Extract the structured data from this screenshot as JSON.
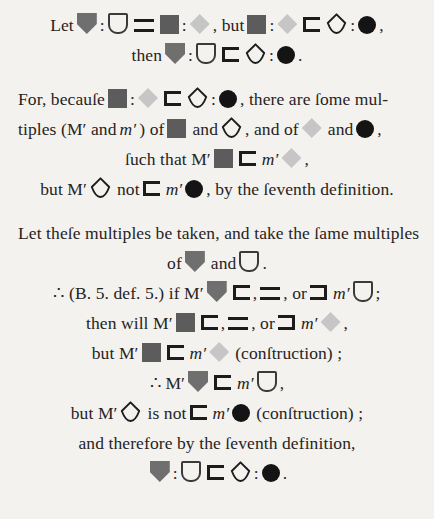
{
  "document": {
    "type": "euclid-proof-page",
    "edition": "Byrne symbolic Euclid (grayscale)",
    "background_color": "#f4f2ee",
    "text_color": "#26241f"
  },
  "symbols": {
    "shield_filled": {
      "name": "shield-filled-grey",
      "color": "#6f6f6f"
    },
    "shield_outline": {
      "name": "shield-outline",
      "color": "#3a3a3a"
    },
    "square_filled": {
      "name": "square-filled-dark-grey",
      "color": "#5c5c5c"
    },
    "diamond_filled": {
      "name": "diamond-filled-light-grey",
      "color": "#c6c6c6"
    },
    "diamond_outline": {
      "name": "diamond-outline",
      "color": "#1c1c1c"
    },
    "circle_filled": {
      "name": "circle-filled-black",
      "color": "#141414"
    },
    "less_than": {
      "name": "less-than-bracket",
      "color": "#1c1c1c"
    },
    "greater_than": {
      "name": "greater-than-bracket",
      "color": "#1c1c1c"
    },
    "equals": {
      "name": "equals-sign",
      "color": "#1c1c1c"
    }
  },
  "blocks": [
    {
      "id": "block-1",
      "lines": [
        {
          "id": "line-1",
          "align": "center",
          "parts": [
            {
              "t": "text",
              "v": "Let"
            },
            {
              "t": "sym",
              "v": "shield_filled"
            },
            {
              "t": "text",
              "v": ":"
            },
            {
              "t": "sym",
              "v": "shield_outline"
            },
            {
              "t": "sym",
              "v": "equals"
            },
            {
              "t": "sym",
              "v": "square_filled"
            },
            {
              "t": "text",
              "v": ":"
            },
            {
              "t": "sym",
              "v": "diamond_filled"
            },
            {
              "t": "text",
              "v": ", but"
            },
            {
              "t": "sym",
              "v": "square_filled"
            },
            {
              "t": "text",
              "v": ":"
            },
            {
              "t": "sym",
              "v": "diamond_filled"
            },
            {
              "t": "sym",
              "v": "less_than"
            },
            {
              "t": "sym",
              "v": "diamond_outline"
            },
            {
              "t": "text",
              "v": ":"
            },
            {
              "t": "sym",
              "v": "circle_filled"
            },
            {
              "t": "text",
              "v": ","
            }
          ]
        },
        {
          "id": "line-2",
          "align": "center",
          "parts": [
            {
              "t": "text",
              "v": "then"
            },
            {
              "t": "sym",
              "v": "shield_filled"
            },
            {
              "t": "text",
              "v": ":"
            },
            {
              "t": "sym",
              "v": "shield_outline"
            },
            {
              "t": "sym",
              "v": "less_than"
            },
            {
              "t": "sym",
              "v": "diamond_outline"
            },
            {
              "t": "text",
              "v": ":"
            },
            {
              "t": "sym",
              "v": "circle_filled"
            },
            {
              "t": "text",
              "v": "."
            }
          ]
        }
      ]
    },
    {
      "id": "block-2",
      "lines": [
        {
          "id": "line-3",
          "align": "left",
          "parts": [
            {
              "t": "text",
              "v": "For, becauſe"
            },
            {
              "t": "sym",
              "v": "square_filled"
            },
            {
              "t": "text",
              "v": ":"
            },
            {
              "t": "sym",
              "v": "diamond_filled"
            },
            {
              "t": "sym",
              "v": "less_than"
            },
            {
              "t": "sym",
              "v": "diamond_outline"
            },
            {
              "t": "text",
              "v": ":"
            },
            {
              "t": "sym",
              "v": "circle_filled"
            },
            {
              "t": "text",
              "v": ", there are ſome mul-"
            }
          ]
        },
        {
          "id": "line-4",
          "align": "left",
          "parts": [
            {
              "t": "text",
              "v": "tiples (M′ and"
            },
            {
              "t": "ital",
              "v": "m′"
            },
            {
              "t": "text",
              "v": ") of"
            },
            {
              "t": "sym",
              "v": "square_filled"
            },
            {
              "t": "text",
              "v": "and"
            },
            {
              "t": "sym",
              "v": "diamond_outline"
            },
            {
              "t": "text",
              "v": ", and of"
            },
            {
              "t": "sym",
              "v": "diamond_filled"
            },
            {
              "t": "text",
              "v": "and"
            },
            {
              "t": "sym",
              "v": "circle_filled"
            },
            {
              "t": "text",
              "v": ","
            }
          ]
        },
        {
          "id": "line-5",
          "align": "center",
          "parts": [
            {
              "t": "text",
              "v": "ſuch that M′"
            },
            {
              "t": "sym",
              "v": "square_filled"
            },
            {
              "t": "sym",
              "v": "less_than"
            },
            {
              "t": "ital",
              "v": "m′"
            },
            {
              "t": "sym",
              "v": "diamond_filled"
            },
            {
              "t": "text",
              "v": ","
            }
          ]
        },
        {
          "id": "line-6",
          "align": "center",
          "parts": [
            {
              "t": "text",
              "v": "but M′"
            },
            {
              "t": "sym",
              "v": "diamond_outline"
            },
            {
              "t": "text",
              "v": "not"
            },
            {
              "t": "sym",
              "v": "less_than"
            },
            {
              "t": "ital",
              "v": "m′"
            },
            {
              "t": "sym",
              "v": "circle_filled"
            },
            {
              "t": "text",
              "v": ", by the ſeventh definition."
            }
          ]
        }
      ]
    },
    {
      "id": "block-3",
      "lines": [
        {
          "id": "line-7",
          "align": "left",
          "parts": [
            {
              "t": "text",
              "v": "Let theſe multiples be taken, and take the ſame multiples"
            }
          ]
        },
        {
          "id": "line-8",
          "align": "center",
          "parts": [
            {
              "t": "text",
              "v": "of"
            },
            {
              "t": "sym",
              "v": "shield_filled"
            },
            {
              "t": "text",
              "v": "and"
            },
            {
              "t": "sym",
              "v": "shield_outline"
            },
            {
              "t": "text",
              "v": "."
            }
          ]
        },
        {
          "id": "line-9",
          "align": "center",
          "parts": [
            {
              "t": "text",
              "v": "∴ (B. 5. def. 5.) if M′"
            },
            {
              "t": "sym",
              "v": "shield_filled"
            },
            {
              "t": "sym",
              "v": "less_than"
            },
            {
              "t": "text",
              "v": ","
            },
            {
              "t": "sym",
              "v": "equals"
            },
            {
              "t": "text",
              "v": ", or"
            },
            {
              "t": "sym",
              "v": "greater_than"
            },
            {
              "t": "ital",
              "v": "m′"
            },
            {
              "t": "sym",
              "v": "shield_outline"
            },
            {
              "t": "text",
              "v": ";"
            }
          ]
        },
        {
          "id": "line-10",
          "align": "center",
          "parts": [
            {
              "t": "text",
              "v": "then will M′"
            },
            {
              "t": "sym",
              "v": "square_filled"
            },
            {
              "t": "sym",
              "v": "less_than"
            },
            {
              "t": "text",
              "v": ","
            },
            {
              "t": "sym",
              "v": "equals"
            },
            {
              "t": "text",
              "v": ", or"
            },
            {
              "t": "sym",
              "v": "greater_than"
            },
            {
              "t": "ital",
              "v": "m′"
            },
            {
              "t": "sym",
              "v": "diamond_filled"
            },
            {
              "t": "text",
              "v": ","
            }
          ]
        },
        {
          "id": "line-11",
          "align": "center",
          "parts": [
            {
              "t": "text",
              "v": "but M′"
            },
            {
              "t": "sym",
              "v": "square_filled"
            },
            {
              "t": "sym",
              "v": "less_than"
            },
            {
              "t": "ital",
              "v": "m′"
            },
            {
              "t": "sym",
              "v": "diamond_filled"
            },
            {
              "t": "text",
              "v": "(conſtruction) ;"
            }
          ]
        },
        {
          "id": "line-12",
          "align": "center",
          "parts": [
            {
              "t": "text",
              "v": "∴ M′"
            },
            {
              "t": "sym",
              "v": "shield_filled"
            },
            {
              "t": "sym",
              "v": "less_than"
            },
            {
              "t": "ital",
              "v": "m′"
            },
            {
              "t": "sym",
              "v": "shield_outline"
            },
            {
              "t": "text",
              "v": ","
            }
          ]
        },
        {
          "id": "line-13",
          "align": "center",
          "parts": [
            {
              "t": "text",
              "v": "but M′"
            },
            {
              "t": "sym",
              "v": "diamond_outline"
            },
            {
              "t": "text",
              "v": "is not"
            },
            {
              "t": "sym",
              "v": "less_than"
            },
            {
              "t": "ital",
              "v": "m′"
            },
            {
              "t": "sym",
              "v": "circle_filled"
            },
            {
              "t": "text",
              "v": "(conſtruction) ;"
            }
          ]
        },
        {
          "id": "line-14",
          "align": "center",
          "parts": [
            {
              "t": "text",
              "v": "and therefore by the ſeventh definition,"
            }
          ]
        },
        {
          "id": "line-15",
          "align": "center",
          "parts": [
            {
              "t": "sym",
              "v": "shield_filled"
            },
            {
              "t": "text",
              "v": ":"
            },
            {
              "t": "sym",
              "v": "shield_outline"
            },
            {
              "t": "sym",
              "v": "less_than"
            },
            {
              "t": "sym",
              "v": "diamond_outline"
            },
            {
              "t": "text",
              "v": ":"
            },
            {
              "t": "sym",
              "v": "circle_filled"
            },
            {
              "t": "text",
              "v": "."
            }
          ]
        }
      ]
    }
  ]
}
